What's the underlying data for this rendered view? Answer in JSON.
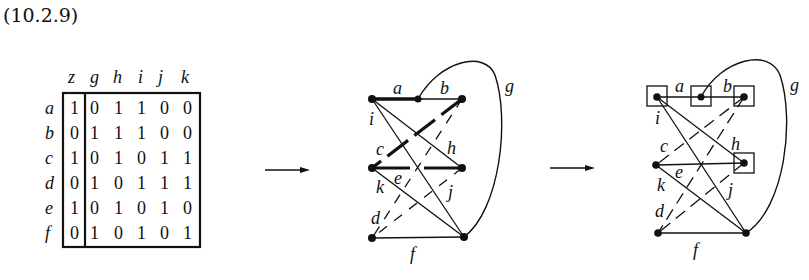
{
  "equation_number": "(10.2.9)",
  "matrix": {
    "col_headers": [
      "z",
      "g",
      "h",
      "i",
      "j",
      "k"
    ],
    "row_labels": [
      "a",
      "b",
      "c",
      "d",
      "e",
      "f"
    ],
    "rows": [
      [
        "1",
        "0",
        "1",
        "1",
        "0",
        "0"
      ],
      [
        "0",
        "1",
        "1",
        "1",
        "0",
        "0"
      ],
      [
        "1",
        "0",
        "1",
        "0",
        "1",
        "1"
      ],
      [
        "0",
        "1",
        "0",
        "1",
        "1",
        "1"
      ],
      [
        "1",
        "0",
        "1",
        "0",
        "1",
        "0"
      ],
      [
        "0",
        "1",
        "0",
        "1",
        "0",
        "1"
      ]
    ]
  },
  "graph_middle": {
    "edge_labels": {
      "a": "a",
      "b": "b",
      "c": "c",
      "d": "d",
      "e": "e",
      "f": "f",
      "g": "g",
      "h": "h",
      "i": "i",
      "j": "j",
      "k": "k"
    }
  },
  "graph_right": {
    "edge_labels": {
      "a": "a",
      "b": "b",
      "c": "c",
      "d": "d",
      "e": "e",
      "f": "f",
      "g": "g",
      "h": "h",
      "i": "i",
      "j": "j",
      "k": "k"
    }
  }
}
